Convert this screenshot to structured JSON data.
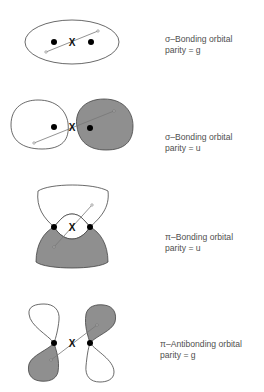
{
  "figure": {
    "panels": [
      {
        "id": "sigma-bonding-g",
        "title": "σ–Bonding orbital",
        "parity": "parity = g"
      },
      {
        "id": "sigma-bonding-u",
        "title": "σ–Bonding orbital",
        "parity": "parity = u"
      },
      {
        "id": "pi-bonding-u",
        "title": "π–Bonding orbital",
        "parity": "parity = u"
      },
      {
        "id": "pi-antibonding-g",
        "title": "π–Antibonding orbital",
        "parity": "parity = g"
      }
    ],
    "center_marker": "X",
    "colors": {
      "shaded_lobe": "#8f8f8f",
      "outline": "#444444",
      "nucleus": "#000000",
      "inversion_line": "#777777",
      "text": "#505050"
    }
  }
}
